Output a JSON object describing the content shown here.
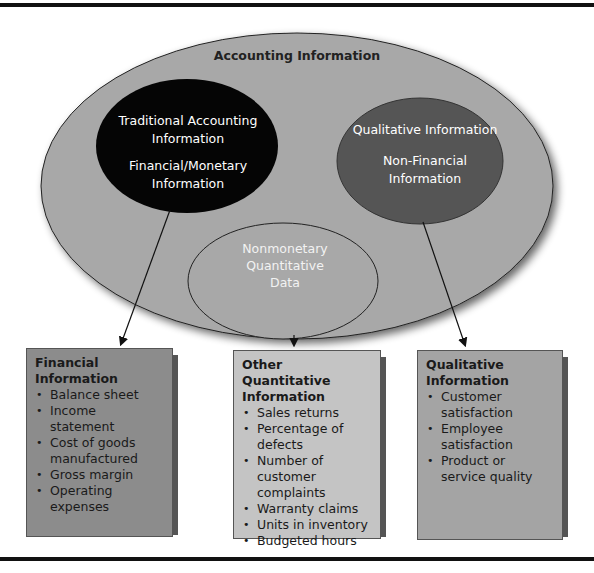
{
  "colors": {
    "outer_ellipse": "#a8a8a8",
    "traditional_ellipse": "#050505",
    "qualitative_ellipse": "#555555",
    "nonmonetary_ellipse": "#a8a8a8",
    "box_financial": "#8c8c8c",
    "box_other": "#c4c4c4",
    "box_qualitative": "#a4a4a4"
  },
  "diagram": {
    "outer": {
      "label": "Accounting Information"
    },
    "traditional": {
      "line1": "Traditional Accounting",
      "line2": "Information",
      "line3": "Financial/Monetary",
      "line4": "Information"
    },
    "qualitative": {
      "line1": "Qualitative Information",
      "line2": "Non-Financial",
      "line3": "Information"
    },
    "nonmonetary": {
      "line1": "Nonmonetary",
      "line2": "Quantitative",
      "line3": "Data"
    }
  },
  "boxes": {
    "financial": {
      "title1": "Financial",
      "title2": "Information",
      "items": [
        [
          "Balance sheet"
        ],
        [
          "Income",
          "statement"
        ],
        [
          "Cost of goods",
          "manufactured"
        ],
        [
          "Gross margin"
        ],
        [
          "Operating",
          "expenses"
        ]
      ]
    },
    "other": {
      "title1": "Other Quantitative",
      "title2": "Information",
      "items": [
        [
          "Sales returns"
        ],
        [
          "Percentage of defects"
        ],
        [
          "Number of customer",
          "complaints"
        ],
        [
          "Warranty claims"
        ],
        [
          "Units in inventory"
        ],
        [
          "Budgeted hours"
        ]
      ]
    },
    "qualitative": {
      "title1": "Qualitative",
      "title2": "Information",
      "items": [
        [
          "Customer",
          "satisfaction"
        ],
        [
          "Employee",
          "satisfaction"
        ],
        [
          "Product or",
          "service quality"
        ]
      ]
    }
  }
}
